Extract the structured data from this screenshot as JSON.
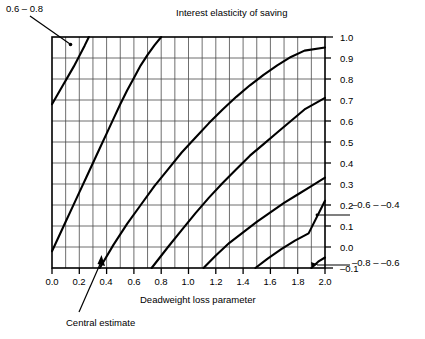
{
  "figure": {
    "top_title": "Interest elasticity of saving",
    "x_axis_title": "Deadweight loss parameter",
    "callout_top_left": "0.6 – 0.8",
    "callout_bottom": "Central estimate",
    "right_external_labels": [
      {
        "text": "–0.6 – –0.4",
        "y_value": 0.15
      },
      {
        "text": "–0.8 – –0.6",
        "y_value": -0.08
      }
    ],
    "band_labels": [
      {
        "text": "0.4 – 0.6",
        "x": 0.28,
        "y": 0.53
      },
      {
        "text": "0.2 – 0.4",
        "x": 0.78,
        "y": 0.53
      },
      {
        "text": "0 – 0.2",
        "x": 1.23,
        "y": 0.53
      },
      {
        "text": "–0.2 – 0",
        "x": 1.6,
        "y": 0.42
      },
      {
        "text": "–0.4 – –0.2",
        "x": 1.63,
        "y": 0.16
      }
    ]
  },
  "chart_data": {
    "type": "line",
    "title": "Interest elasticity of saving",
    "xlabel": "Deadweight loss parameter",
    "ylabel": "Interest elasticity of saving",
    "xlim": [
      0.0,
      2.0
    ],
    "ylim": [
      -0.1,
      1.0
    ],
    "grid": true,
    "x_major_ticks": [
      0.0,
      0.2,
      0.4,
      0.6,
      0.8,
      1.0,
      1.2,
      1.4,
      1.6,
      1.8,
      2.0
    ],
    "x_major_tick_labels": [
      "0.0",
      "0.2",
      "0.4",
      "0.6",
      "0.8",
      "1.0",
      "1.2",
      "1.4",
      "1.6",
      "1.8",
      "2.0"
    ],
    "x_minor_step": 0.1,
    "y_major_ticks": [
      -0.1,
      0.0,
      0.1,
      0.2,
      0.3,
      0.4,
      0.5,
      0.6,
      0.7,
      0.8,
      0.9,
      1.0
    ],
    "y_major_tick_labels": [
      "–0.1",
      "0.0",
      "0.1",
      "0.2",
      "0.3",
      "0.4",
      "0.5",
      "0.6",
      "0.7",
      "0.8",
      "0.9",
      "1.0"
    ],
    "y_axis_side": "right",
    "legend": "none",
    "line_color": "#000000",
    "grid_color": "#555555",
    "series": [
      {
        "name": "boundary 0.6 / 0.8",
        "x": [
          0.0,
          0.04,
          0.08,
          0.12,
          0.16,
          0.2,
          0.24,
          0.27
        ],
        "values": [
          0.68,
          0.725,
          0.77,
          0.815,
          0.86,
          0.91,
          0.96,
          1.0
        ]
      },
      {
        "name": "boundary 0.4 / 0.6",
        "x": [
          0.0,
          0.05,
          0.1,
          0.15,
          0.2,
          0.25,
          0.3,
          0.35,
          0.4,
          0.45,
          0.5,
          0.55,
          0.6,
          0.65,
          0.7,
          0.75,
          0.8
        ],
        "values": [
          -0.02,
          0.05,
          0.12,
          0.19,
          0.26,
          0.33,
          0.4,
          0.47,
          0.54,
          0.61,
          0.68,
          0.745,
          0.805,
          0.865,
          0.915,
          0.96,
          1.0
        ]
      },
      {
        "name": "boundary 0.2 / 0.4",
        "x": [
          0.35,
          0.45,
          0.55,
          0.65,
          0.75,
          0.85,
          0.95,
          1.05,
          1.15,
          1.25,
          1.35,
          1.45,
          1.55,
          1.65,
          1.75,
          1.85,
          2.0
        ],
        "values": [
          -0.1,
          0.01,
          0.11,
          0.2,
          0.29,
          0.37,
          0.45,
          0.52,
          0.59,
          0.655,
          0.715,
          0.77,
          0.82,
          0.865,
          0.905,
          0.935,
          0.95
        ]
      },
      {
        "name": "boundary 0 / 0.2",
        "x": [
          0.73,
          0.85,
          0.95,
          1.05,
          1.15,
          1.25,
          1.35,
          1.45,
          1.55,
          1.65,
          1.75,
          1.85,
          2.0
        ],
        "values": [
          -0.1,
          0.0,
          0.08,
          0.16,
          0.235,
          0.305,
          0.37,
          0.435,
          0.49,
          0.545,
          0.6,
          0.655,
          0.71
        ]
      },
      {
        "name": "boundary –0.2 / 0",
        "x": [
          1.11,
          1.2,
          1.3,
          1.4,
          1.5,
          1.6,
          1.7,
          1.8,
          1.9,
          2.0
        ],
        "values": [
          -0.1,
          -0.04,
          0.02,
          0.07,
          0.12,
          0.165,
          0.21,
          0.25,
          0.29,
          0.33
        ]
      },
      {
        "name": "boundary –0.4 / –0.2",
        "x": [
          1.49,
          1.58,
          1.68,
          1.78,
          1.88,
          2.0
        ],
        "values": [
          -0.1,
          -0.055,
          -0.01,
          0.03,
          0.065,
          0.22
        ]
      },
      {
        "name": "boundary –0.6 / –0.4",
        "x": [
          1.9,
          1.95,
          2.0
        ],
        "values": [
          -0.1,
          -0.07,
          -0.05
        ]
      }
    ],
    "annotations": [
      {
        "text": "0.6 – 0.8",
        "target_x": 0.12,
        "target_y": 0.93,
        "type": "callout"
      },
      {
        "text": "Central estimate",
        "target_x": 0.36,
        "target_y": -0.04,
        "type": "callout-arrow"
      }
    ]
  }
}
